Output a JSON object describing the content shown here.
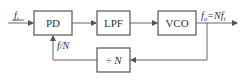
{
  "diagram": {
    "type": "PLL block diagram",
    "blocks": {
      "pd": "PD",
      "lpf": "LPF",
      "vco": "VCO",
      "divider": "÷ N"
    },
    "signals": {
      "input": "f",
      "input_sub": "i",
      "feedback": "f/N",
      "output_main": "f",
      "output_sub": "o",
      "output_eq": "=Nf",
      "output_eq_sub": "i"
    },
    "colors": {
      "stroke": "#555555",
      "text": "#333333",
      "background": "#ffffff"
    }
  }
}
